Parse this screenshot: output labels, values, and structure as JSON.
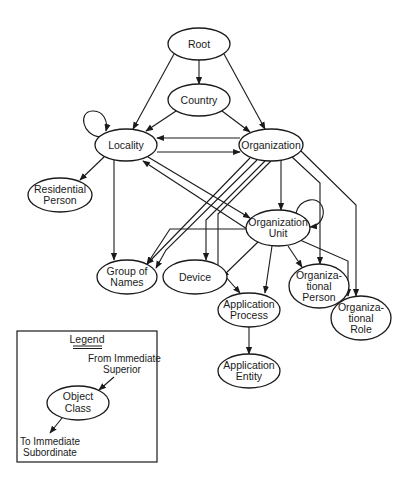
{
  "diagram": {
    "nodes": [
      {
        "id": "root",
        "lines": [
          "Root"
        ],
        "cx": 199,
        "cy": 44,
        "rx": 31,
        "ry": 16
      },
      {
        "id": "country",
        "lines": [
          "Country"
        ],
        "cx": 199,
        "cy": 100,
        "rx": 31,
        "ry": 16
      },
      {
        "id": "locality",
        "lines": [
          "Locality"
        ],
        "cx": 126,
        "cy": 145,
        "rx": 31,
        "ry": 16
      },
      {
        "id": "organization",
        "lines": [
          "Organization"
        ],
        "cx": 271,
        "cy": 145,
        "rx": 32,
        "ry": 16
      },
      {
        "id": "residential-person",
        "lines": [
          "Residential",
          "Person"
        ],
        "cx": 60,
        "cy": 195,
        "rx": 32,
        "ry": 17
      },
      {
        "id": "organization-unit",
        "lines": [
          "Organization",
          "Unit"
        ],
        "cx": 278,
        "cy": 228,
        "rx": 32,
        "ry": 18
      },
      {
        "id": "group-of-names",
        "lines": [
          "Group of",
          "Names"
        ],
        "cx": 127,
        "cy": 277,
        "rx": 30,
        "ry": 17
      },
      {
        "id": "device",
        "lines": [
          "Device"
        ],
        "cx": 195,
        "cy": 277,
        "rx": 32,
        "ry": 17
      },
      {
        "id": "application-process",
        "lines": [
          "Application",
          "Process"
        ],
        "cx": 249,
        "cy": 310,
        "rx": 31,
        "ry": 17
      },
      {
        "id": "organizational-person",
        "lines": [
          "Organiza-",
          "tional",
          "Person"
        ],
        "cx": 319,
        "cy": 286,
        "rx": 30,
        "ry": 22
      },
      {
        "id": "organizational-role",
        "lines": [
          "Organiza-",
          "tional",
          "Role"
        ],
        "cx": 361,
        "cy": 318,
        "rx": 30,
        "ry": 22
      },
      {
        "id": "application-entity",
        "lines": [
          "Application",
          "Entity"
        ],
        "cx": 249,
        "cy": 371,
        "rx": 31,
        "ry": 17
      }
    ],
    "edges": [
      {
        "from": "root",
        "to": "country",
        "d": "M199,60 L199,84"
      },
      {
        "from": "root",
        "to": "locality",
        "d": "M174,54 L133,129"
      },
      {
        "from": "root",
        "to": "organization",
        "d": "M224,54 L265,129"
      },
      {
        "from": "country",
        "to": "locality",
        "d": "M176,111 L146,131"
      },
      {
        "from": "country",
        "to": "organization",
        "d": "M222,111 L250,132"
      },
      {
        "from": "locality",
        "to": "locality",
        "d": "M100,137 C82,135 78,112 92,111 C104,110 108,122 106,131"
      },
      {
        "from": "organization",
        "to": "locality",
        "d": "M240,138 L157,138"
      },
      {
        "from": "locality",
        "to": "organization",
        "d": "M157,152 L240,152"
      },
      {
        "from": "locality",
        "to": "residential-person",
        "d": "M104,157 L80,180"
      },
      {
        "from": "locality",
        "to": "group-of-names",
        "d": "M114,160 L114,260"
      },
      {
        "from": "locality",
        "to": "organization-unit",
        "d": "M148,157 L250,218"
      },
      {
        "from": "organization-unit",
        "to": "locality",
        "d": "M247,229 L143,161"
      },
      {
        "from": "organization",
        "to": "group-of-names",
        "d": "M250,158 L147,264"
      },
      {
        "from": "organization",
        "to": "group-of-names",
        "d": "M257,160 L166,250 L156,268"
      },
      {
        "from": "organization",
        "to": "device",
        "d": "M265,161 L206,220 L206,260"
      },
      {
        "from": "organization",
        "to": "application-process",
        "d": "M271,161 L218,214 L218,268 L240,293"
      },
      {
        "from": "organization",
        "to": "organization-unit",
        "d": "M281,160 L281,210"
      },
      {
        "from": "organization",
        "to": "organizational-person",
        "d": "M292,157 L320,183 L320,264"
      },
      {
        "from": "organization",
        "to": "organizational-role",
        "d": "M300,150 L356,205 L356,296"
      },
      {
        "from": "organization-unit",
        "to": "organization-unit",
        "d": "M296,213 C300,198 318,196 322,206 C326,216 320,226 310,227"
      },
      {
        "from": "organization-unit",
        "to": "group-of-names",
        "d": "M246,229 L170,229 L147,264"
      },
      {
        "from": "organization-unit",
        "to": "device",
        "d": "M258,242 L222,277"
      },
      {
        "from": "organization-unit",
        "to": "application-process",
        "d": "M272,246 L265,293"
      },
      {
        "from": "organization-unit",
        "to": "organizational-person",
        "d": "M288,246 L302,267"
      },
      {
        "from": "organization-unit",
        "to": "organizational-role",
        "d": "M300,240 L348,261 L348,296"
      },
      {
        "from": "application-process",
        "to": "application-entity",
        "d": "M249,327 L249,354"
      }
    ]
  },
  "legend": {
    "title": "Legend",
    "from_label_1": "From Immediate",
    "from_label_2": "Superior",
    "node_lines": [
      "Object",
      "Class"
    ],
    "to_label_1": "To Immediate",
    "to_label_2": "Subordinate"
  }
}
